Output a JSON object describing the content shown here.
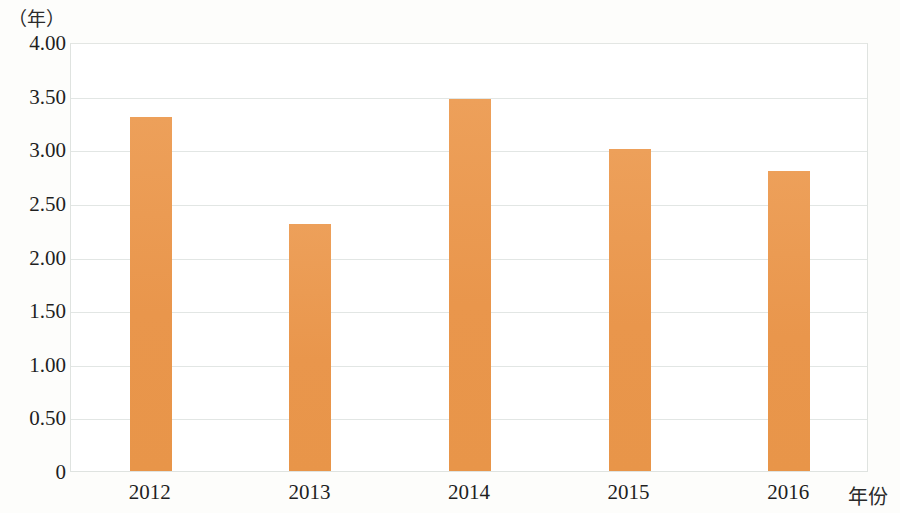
{
  "chart_data": {
    "type": "bar",
    "title": "",
    "subtitle": "",
    "xlabel": "年份",
    "ylabel": "（年）",
    "y_unit_caption": "（年）",
    "categories": [
      "2012",
      "2013",
      "2014",
      "2015",
      "2016"
    ],
    "values": [
      3.3,
      2.3,
      3.47,
      3.0,
      2.8
    ],
    "series": [
      {
        "name": "",
        "values": [
          3.3,
          2.3,
          3.47,
          3.0,
          2.8
        ],
        "color": "#eb9a51"
      }
    ],
    "ylim": [
      0,
      4.0
    ],
    "y_ticks": [
      4.0,
      3.5,
      3.0,
      2.5,
      2.0,
      1.5,
      1.0,
      0.5,
      0
    ],
    "y_tick_labels": [
      "4.00",
      "3.50",
      "3.00",
      "2.50",
      "2.00",
      "1.50",
      "1.00",
      "0.50",
      "0"
    ],
    "grid": true,
    "grid_axis": "y",
    "legend": false,
    "legend_position": "none",
    "bar_color": "#eb9a51",
    "gridline_color": "#e2e6e4",
    "plot_border_color": "#dfe3e0",
    "background_color": "#fdfdfb",
    "text_color": "#1f1f1f",
    "annotations": []
  }
}
